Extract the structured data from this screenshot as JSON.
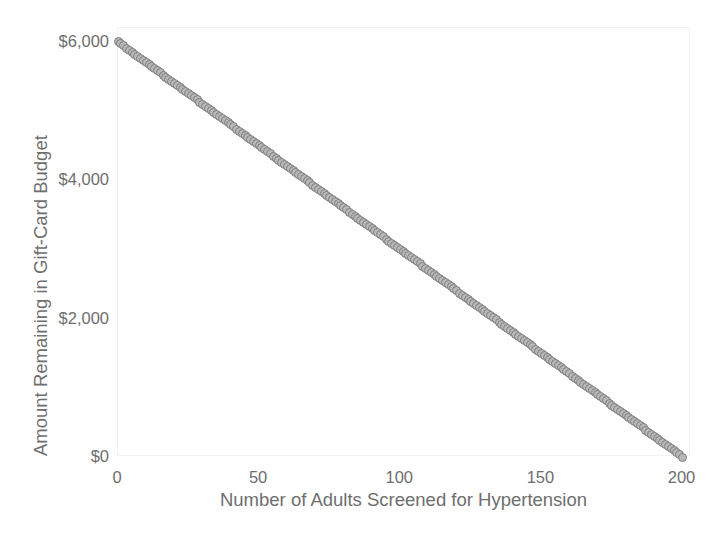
{
  "chart_data": {
    "type": "scatter",
    "title": "",
    "xlabel": "Number of Adults Screened for Hypertension",
    "ylabel": "Amount Remaining in Gift-Card Budget",
    "xlim": [
      0,
      203
    ],
    "ylim": [
      0,
      6200
    ],
    "xticks": [
      0,
      50,
      100,
      150,
      200
    ],
    "xticklabels": [
      "0",
      "50",
      "100",
      "150",
      "200"
    ],
    "yticks": [
      0,
      2000,
      4000,
      6000
    ],
    "yticklabels": [
      "$0",
      "$2,000",
      "$4,000",
      "$6,000"
    ],
    "grid": false,
    "legend": null,
    "marker": {
      "shape": "circle",
      "edge_color": "#7e7e7e",
      "face_color": "#b9b9b9",
      "size_px": 9
    },
    "relationship": "linear decreasing",
    "slope_per_adult": -30,
    "intercept": 6000,
    "n_points": 201,
    "x": [
      0,
      1,
      2,
      3,
      4,
      5,
      6,
      7,
      8,
      9,
      10,
      11,
      12,
      13,
      14,
      15,
      16,
      17,
      18,
      19,
      20,
      21,
      22,
      23,
      24,
      25,
      26,
      27,
      28,
      29,
      30,
      31,
      32,
      33,
      34,
      35,
      36,
      37,
      38,
      39,
      40,
      41,
      42,
      43,
      44,
      45,
      46,
      47,
      48,
      49,
      50,
      51,
      52,
      53,
      54,
      55,
      56,
      57,
      58,
      59,
      60,
      61,
      62,
      63,
      64,
      65,
      66,
      67,
      68,
      69,
      70,
      71,
      72,
      73,
      74,
      75,
      76,
      77,
      78,
      79,
      80,
      81,
      82,
      83,
      84,
      85,
      86,
      87,
      88,
      89,
      90,
      91,
      92,
      93,
      94,
      95,
      96,
      97,
      98,
      99,
      100,
      101,
      102,
      103,
      104,
      105,
      106,
      107,
      108,
      109,
      110,
      111,
      112,
      113,
      114,
      115,
      116,
      117,
      118,
      119,
      120,
      121,
      122,
      123,
      124,
      125,
      126,
      127,
      128,
      129,
      130,
      131,
      132,
      133,
      134,
      135,
      136,
      137,
      138,
      139,
      140,
      141,
      142,
      143,
      144,
      145,
      146,
      147,
      148,
      149,
      150,
      151,
      152,
      153,
      154,
      155,
      156,
      157,
      158,
      159,
      160,
      161,
      162,
      163,
      164,
      165,
      166,
      167,
      168,
      169,
      170,
      171,
      172,
      173,
      174,
      175,
      176,
      177,
      178,
      179,
      180,
      181,
      182,
      183,
      184,
      185,
      186,
      187,
      188,
      189,
      190,
      191,
      192,
      193,
      194,
      195,
      196,
      197,
      198,
      199,
      200
    ],
    "y": [
      6000,
      5970,
      5940,
      5910,
      5880,
      5850,
      5820,
      5790,
      5760,
      5730,
      5700,
      5670,
      5640,
      5610,
      5580,
      5550,
      5520,
      5490,
      5460,
      5430,
      5400,
      5370,
      5340,
      5310,
      5280,
      5250,
      5220,
      5190,
      5160,
      5130,
      5100,
      5070,
      5040,
      5010,
      4980,
      4950,
      4920,
      4890,
      4860,
      4830,
      4800,
      4770,
      4740,
      4710,
      4680,
      4650,
      4620,
      4590,
      4560,
      4530,
      4500,
      4470,
      4440,
      4410,
      4380,
      4350,
      4320,
      4290,
      4260,
      4230,
      4200,
      4170,
      4140,
      4110,
      4080,
      4050,
      4020,
      3990,
      3960,
      3930,
      3900,
      3870,
      3840,
      3810,
      3780,
      3750,
      3720,
      3690,
      3660,
      3630,
      3600,
      3570,
      3540,
      3510,
      3480,
      3450,
      3420,
      3390,
      3360,
      3330,
      3300,
      3270,
      3240,
      3210,
      3180,
      3150,
      3120,
      3090,
      3060,
      3030,
      3000,
      2970,
      2940,
      2910,
      2880,
      2850,
      2820,
      2790,
      2760,
      2730,
      2700,
      2670,
      2640,
      2610,
      2580,
      2550,
      2520,
      2490,
      2460,
      2430,
      2400,
      2370,
      2340,
      2310,
      2280,
      2250,
      2220,
      2190,
      2160,
      2130,
      2100,
      2070,
      2040,
      2010,
      1980,
      1950,
      1920,
      1890,
      1860,
      1830,
      1800,
      1770,
      1740,
      1710,
      1680,
      1650,
      1620,
      1590,
      1560,
      1530,
      1500,
      1470,
      1440,
      1410,
      1380,
      1350,
      1320,
      1290,
      1260,
      1230,
      1200,
      1170,
      1140,
      1110,
      1080,
      1050,
      1020,
      990,
      960,
      930,
      900,
      870,
      840,
      810,
      780,
      750,
      720,
      690,
      660,
      630,
      600,
      570,
      540,
      510,
      480,
      450,
      420,
      390,
      360,
      330,
      300,
      270,
      240,
      210,
      180,
      150,
      120,
      90,
      60,
      30,
      0
    ]
  },
  "colors": {
    "text": "#6e6e6e",
    "marker_edge": "#7e7e7e",
    "marker_face": "#b9b9b9",
    "frame": "#f2f2f2",
    "background": "#ffffff"
  }
}
